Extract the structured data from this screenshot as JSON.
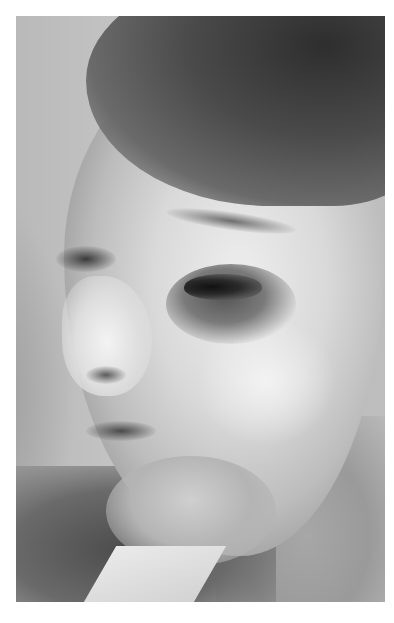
{
  "image": {
    "type": "photograph",
    "color_mode": "grayscale",
    "subject": "woman's face in three-quarter left profile with bruising around the right eye",
    "photo_bounds": {
      "left": 16,
      "top": 16,
      "width": 369,
      "height": 586
    },
    "background_color": "#ffffff",
    "tones": {
      "background_wall": "#bdbdbd",
      "hair": "#2e2e2e",
      "skin_highlight": "#eeeeee",
      "bruise": "#555555",
      "shadow": "#4d4d4d"
    }
  }
}
